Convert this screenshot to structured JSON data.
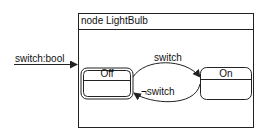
{
  "diagram": {
    "type": "state-machine",
    "node": {
      "title": "node LightBulb"
    },
    "input": {
      "label": "switch:bool"
    },
    "states": [
      {
        "name": "Off",
        "initial": true
      },
      {
        "name": "On",
        "initial": false
      }
    ],
    "transitions": [
      {
        "from": "Off",
        "to": "On",
        "label": "switch"
      },
      {
        "from": "On",
        "to": "Off",
        "label": "¬switch"
      }
    ],
    "colors": {
      "stroke": "#222222",
      "background": "#ffffff"
    }
  }
}
